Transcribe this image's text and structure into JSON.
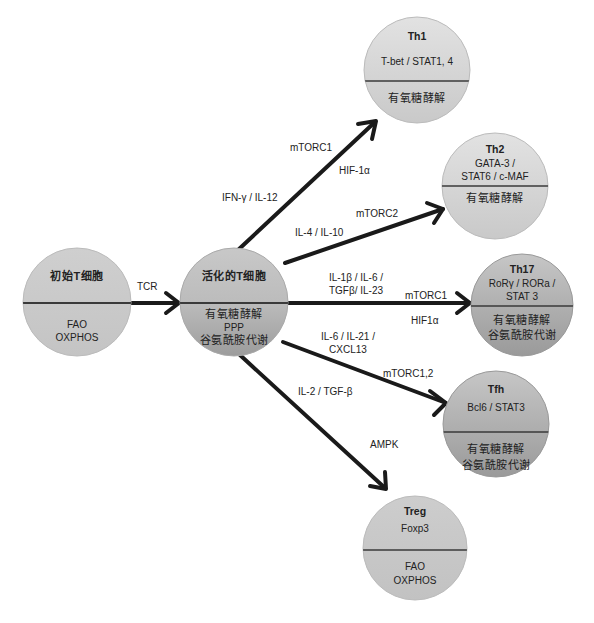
{
  "diagram": {
    "nodes": {
      "naive": {
        "title": "初始T细胞",
        "metabolism": [
          "FAO",
          "OXPHOS"
        ]
      },
      "activated": {
        "title": "活化的T细胞",
        "metabolism": [
          "有氧糖酵解",
          "PPP",
          "谷氨酰胺代谢"
        ]
      },
      "th1": {
        "title": "Th1",
        "factors": [
          "T-bet / STAT1, 4"
        ],
        "metabolism": [
          "有氧糖酵解"
        ]
      },
      "th2": {
        "title": "Th2",
        "factors": [
          "GATA-3 /",
          "STAT6 / c-MAF"
        ],
        "metabolism": [
          "有氧糖酵解"
        ]
      },
      "th17": {
        "title": "Th17",
        "factors": [
          "RoRγ / RORa /",
          "STAT 3"
        ],
        "metabolism": [
          "有氧糖酵解",
          "谷氨酰胺代谢"
        ]
      },
      "tfh": {
        "title": "Tfh",
        "factors": [
          "Bcl6 / STAT3"
        ],
        "metabolism": [
          "有氧糖酵解",
          "谷氨酰胺代谢"
        ]
      },
      "treg": {
        "title": "Treg",
        "factors": [
          "Foxp3"
        ],
        "metabolism": [
          "FAO",
          "OXPHOS"
        ]
      }
    },
    "edges": {
      "tcr": {
        "label": "TCR"
      },
      "th1": {
        "cytokines": "IFN-γ / IL-12",
        "signal": "mTORC1",
        "factor": "HIF-1α"
      },
      "th2": {
        "cytokines": "IL-4 / IL-10",
        "signal": "mTORC2"
      },
      "th17": {
        "cytokines_1": "IL-1β / IL-6 /",
        "cytokines_2": "TGFβ/ IL-23",
        "signal": "mTORC1",
        "factor": "HIF1α"
      },
      "tfh": {
        "cytokines_1": "IL-6 / IL-21 /",
        "cytokines_2": "CXCL13",
        "signal": "mTORC1,2"
      },
      "treg": {
        "cytokines": "IL-2 / TGF-β",
        "signal": "AMPK"
      }
    },
    "colors": {
      "circle_light": "#d3d3d3",
      "circle_mid": "#c2c2c2",
      "circle_dark": "#a9a9a9",
      "arrow": "#1a1a1a",
      "divider": "#3a3a3a"
    }
  }
}
